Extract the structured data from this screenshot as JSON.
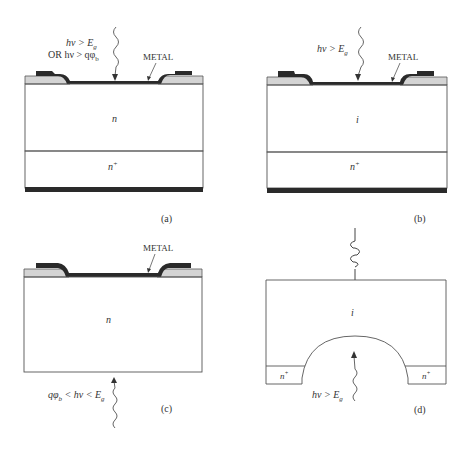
{
  "figure": {
    "panels": [
      {
        "id": "a",
        "caption": "(a)",
        "light_label_line1": "hν > E",
        "light_label_line1_sub": "g",
        "light_label_line2": "OR hν > qφ",
        "light_label_line2_sub": "b",
        "metal_label": "METAL",
        "region_top": "n",
        "region_bottom": "n",
        "region_bottom_sup": "+"
      },
      {
        "id": "b",
        "caption": "(b)",
        "light_label": "hν > E",
        "light_label_sub": "g",
        "metal_label": "METAL",
        "region_top": "i",
        "region_bottom": "n",
        "region_bottom_sup": "+"
      },
      {
        "id": "c",
        "caption": "(c)",
        "light_label_pre": "qφ",
        "light_label_pre_sub": "b",
        "light_label_mid": " < hν < E",
        "light_label_sub": "g",
        "metal_label": "METAL",
        "region": "n"
      },
      {
        "id": "d",
        "caption": "(d)",
        "light_label": "hν > E",
        "light_label_sub": "g",
        "region": "i",
        "contact_left": "n",
        "contact_right": "n",
        "contact_sup": "+"
      }
    ],
    "colors": {
      "line": "#444444",
      "metal": "#2a2a2a",
      "oxide": "#d4d4d4",
      "background": "#ffffff"
    }
  }
}
